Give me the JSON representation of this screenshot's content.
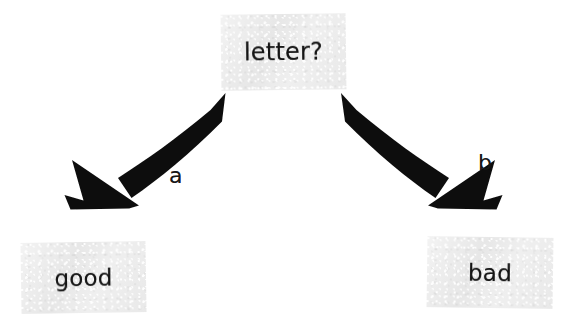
{
  "diagram": {
    "type": "decision-tree",
    "background_color": "#ffffff",
    "node_fill_color": "#ebebeb",
    "ink_color": "#141414",
    "nodes": [
      {
        "id": "letter",
        "label": "letter?",
        "role": "decision"
      },
      {
        "id": "good",
        "label": "good",
        "role": "outcome"
      },
      {
        "id": "bad",
        "label": "bad",
        "role": "outcome"
      }
    ],
    "edges": [
      {
        "id": "edge-a",
        "label": "a",
        "from": "letter",
        "to": "good",
        "direction": "down-left"
      },
      {
        "id": "edge-b",
        "label": "b",
        "from": "letter",
        "to": "bad",
        "direction": "down-right"
      }
    ]
  }
}
